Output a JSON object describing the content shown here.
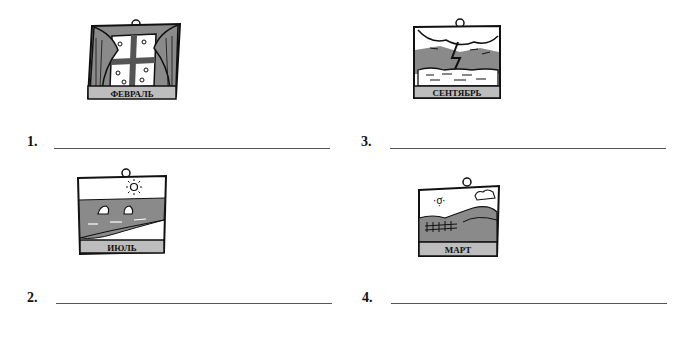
{
  "pictures": [
    {
      "id": 1,
      "label": "ФЕВРАЛЬ",
      "scene": "window-with-curtains-snow"
    },
    {
      "id": 2,
      "label": "ИЮЛЬ",
      "scene": "beach-with-swimmers-sun"
    },
    {
      "id": 3,
      "label": "СЕНТЯБРЬ",
      "scene": "storm-lightning-sea"
    },
    {
      "id": 4,
      "label": "МАРТ",
      "scene": "countryside-fields-sun"
    }
  ],
  "answers": [
    {
      "number": "1.",
      "value": ""
    },
    {
      "number": "2.",
      "value": ""
    },
    {
      "number": "3.",
      "value": ""
    },
    {
      "number": "4.",
      "value": ""
    }
  ],
  "colors": {
    "ink": "#111111",
    "shade": "#8a8a8a",
    "label_bg": "#bdbdbd",
    "rule": "#555555"
  }
}
